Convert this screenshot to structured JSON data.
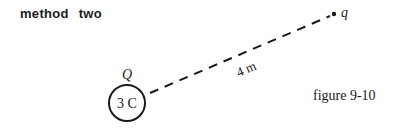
{
  "title": "method two",
  "diagram": {
    "source_charge": {
      "label": "Q",
      "value": "3 C"
    },
    "test_charge": {
      "label": "q"
    },
    "distance_label": "4 m",
    "caption": "figure 9-10"
  }
}
